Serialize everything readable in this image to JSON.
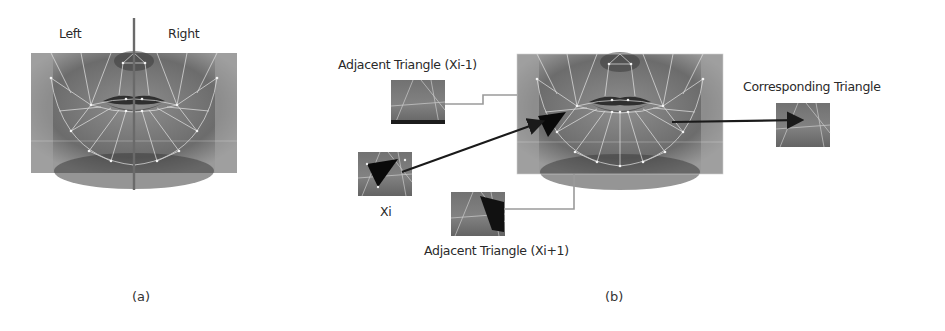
{
  "figure": {
    "panel_a": {
      "caption": "(a)",
      "left_label": "Left",
      "right_label": "Right",
      "midline_color": "#6a6a6a"
    },
    "panel_b": {
      "caption": "(b)",
      "adjacent_prev": {
        "title": "Adjacent Triangle",
        "index": "(Xi-1)"
      },
      "current": {
        "label": "Xi"
      },
      "adjacent_next": {
        "title": "Adjacent Triangle",
        "index": "(Xi+1)"
      },
      "corresponding": {
        "title": "Corresponding Triangle"
      }
    },
    "colors": {
      "face_fill": "#7d7d7d",
      "mesh_line": "#e6e6e6",
      "connector": "#9a9a9a",
      "arrow": "#1a1a1a",
      "highlight_triangle": "#0a0a0a"
    }
  }
}
